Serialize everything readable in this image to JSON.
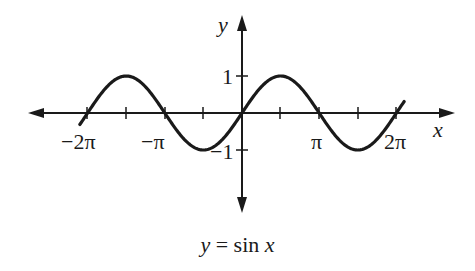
{
  "chart_data": {
    "type": "line",
    "title": "y = sin x",
    "xlabel": "x",
    "ylabel": "y",
    "x_tick_labels": [
      "−2π",
      "−π",
      "π",
      "2π"
    ],
    "x_tick_values": [
      -6.2832,
      -4.7124,
      -3.1416,
      -1.5708,
      0,
      1.5708,
      3.1416,
      4.7124,
      6.2832
    ],
    "y_tick_labels": [
      "1",
      "−1"
    ],
    "y_tick_values": [
      1,
      -1
    ],
    "xlim": [
      -2.15,
      2.15
    ],
    "xlim_units": "multiples of pi",
    "ylim": [
      -1,
      1
    ],
    "grid": false,
    "legend": "none",
    "series": [
      {
        "name": "sin x",
        "x": [
          -6.6,
          -6.2832,
          -5.4978,
          -4.7124,
          -3.1416,
          -2.3562,
          -1.5708,
          0,
          1.5708,
          3.1416,
          4.7124,
          6.2832,
          6.6
        ],
        "y": [
          0.311,
          0,
          0.707,
          1,
          0,
          -0.707,
          -1,
          0,
          1,
          0,
          -1,
          0,
          0.311
        ]
      }
    ]
  },
  "labels": {
    "y_axis": "y",
    "x_axis": "x",
    "neg_two_pi": "−2π",
    "neg_pi": "−π",
    "pi": "π",
    "two_pi": "2π",
    "one": "1",
    "neg_one": "−1",
    "caption_y": "y",
    "caption_eq": " = sin ",
    "caption_x": "x"
  }
}
